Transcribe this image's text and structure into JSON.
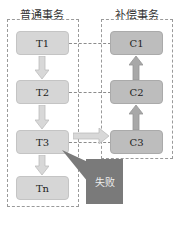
{
  "titles": {
    "normal": "普通事务",
    "compensate": "补偿事务"
  },
  "normal_tx": [
    {
      "label": "T1"
    },
    {
      "label": "T2"
    },
    {
      "label": "T3"
    },
    {
      "label": "Tn"
    }
  ],
  "compensate_tx": [
    {
      "label": "C1"
    },
    {
      "label": "C2"
    },
    {
      "label": "C3"
    }
  ],
  "callout": {
    "label": "失败"
  },
  "colors": {
    "normal_box": "#d6d6d6",
    "compensate_box": "#bdbdbd",
    "callout": "#7a7a7a"
  }
}
